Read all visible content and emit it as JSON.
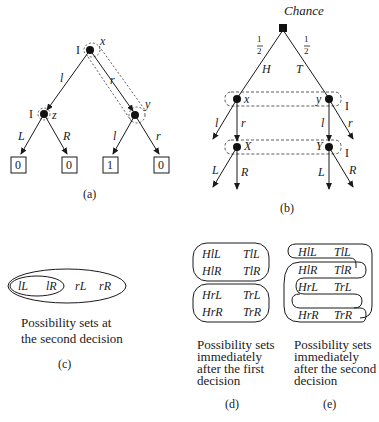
{
  "figure_a": {
    "caption": "(a)",
    "player_label": "I",
    "nodes": {
      "root": "x",
      "left": "z",
      "right": "y"
    },
    "edges": {
      "root_left": "l",
      "root_right": "r",
      "z_left": "L",
      "z_right": "R",
      "y_left": "l",
      "y_right": "r"
    },
    "payoffs": [
      "0",
      "0",
      "1",
      "0"
    ]
  },
  "figure_b": {
    "caption": "(b)",
    "chance_label": "Chance",
    "prob_left": "1/2",
    "prob_right": "1/2",
    "chance_edges": {
      "left": "H",
      "right": "T"
    },
    "player_label": "I",
    "upper_nodes": {
      "left": "x",
      "right": "y"
    },
    "upper_edges": {
      "x_left": "l",
      "x_right": "r",
      "y_left": "l",
      "y_right": "r"
    },
    "lower_nodes": {
      "left": "X",
      "right": "Y"
    },
    "lower_edges": {
      "X_left": "L",
      "X_right": "R",
      "Y_left": "L",
      "Y_right": "R"
    }
  },
  "figure_c": {
    "caption": "(c)",
    "items": [
      "lL",
      "lR",
      "rL",
      "rR"
    ],
    "description_line1": "Possibility sets at",
    "description_line2": "the second decision"
  },
  "figure_d": {
    "caption": "(d)",
    "set1": [
      "HlL",
      "TlL",
      "HlR",
      "TlR"
    ],
    "set2": [
      "HrL",
      "TrL",
      "HrR",
      "TrR"
    ],
    "description_lines": [
      "Possibility sets",
      "immediately",
      "after the first",
      "decision"
    ]
  },
  "figure_e": {
    "caption": "(e)",
    "rows": [
      [
        "HlL",
        "TlL"
      ],
      [
        "HlR",
        "TlR"
      ],
      [
        "HrL",
        "TrL"
      ],
      [
        "HrR",
        "TrR"
      ]
    ],
    "description_lines": [
      "Possibility sets",
      "immediately",
      "after the second",
      "decision"
    ]
  }
}
